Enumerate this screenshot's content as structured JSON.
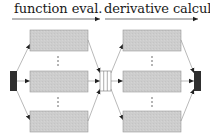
{
  "diagram": {
    "stages": [
      {
        "id": "stage-1",
        "label": "function eval."
      },
      {
        "id": "stage-2",
        "label": "derivative calcul."
      }
    ],
    "colors": {
      "block_fill": "#cccccc",
      "block_stroke": "#9a9a9a",
      "terminal_fill": "#2f2f2f",
      "edge": "#888888",
      "arrow": "#222222",
      "text": "#1a1a1a"
    },
    "nodes": {
      "source": "dark terminal block (input)",
      "left_parallel_blocks": 3,
      "splitter": "3-compartment joiner/splitter",
      "right_parallel_blocks": 3,
      "sink": "dark terminal block (output)"
    },
    "ellipsis": "⋮"
  }
}
